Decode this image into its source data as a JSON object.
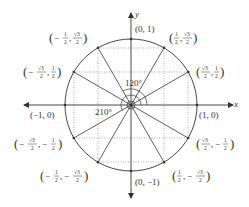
{
  "diagram": {
    "center": {
      "x": 131,
      "y": 105
    },
    "radius": 66,
    "colors": {
      "stroke": "#333333",
      "grid": "#777777",
      "text": "#333333",
      "background": "#ffffff"
    },
    "axes": {
      "x_label": "x",
      "y_label": "y"
    },
    "angle_labels": {
      "a120": "120°",
      "a210": "210°"
    },
    "points": [
      {
        "angle": 0,
        "label": "(1, 0)"
      },
      {
        "angle": 30,
        "label": "(√3/2, 1/2)"
      },
      {
        "angle": 60,
        "label": "(1/2, √3/2)"
      },
      {
        "angle": 90,
        "label": "(0, 1)"
      },
      {
        "angle": 120,
        "label": "(−1/2, √3/2)"
      },
      {
        "angle": 150,
        "label": "(−√3/2, 1/2)"
      },
      {
        "angle": 180,
        "label": "(−1, 0)"
      },
      {
        "angle": 210,
        "label": "(−√3/2, −1/2)"
      },
      {
        "angle": 240,
        "label": "(−1/2, −√3/2)"
      },
      {
        "angle": 270,
        "label": "(0, −1)"
      },
      {
        "angle": 300,
        "label": "(1/2, −√3/2)"
      },
      {
        "angle": 330,
        "label": "(√3/2, −1/2)"
      }
    ],
    "labels": {
      "p0": "(1, 0)",
      "p90": "(0, 1)",
      "p180": "(−1, 0)",
      "p270": "(0, −1)",
      "half": "1",
      "two": "2",
      "sqrt3": "√3",
      "neg": "−",
      "comma": ","
    }
  }
}
